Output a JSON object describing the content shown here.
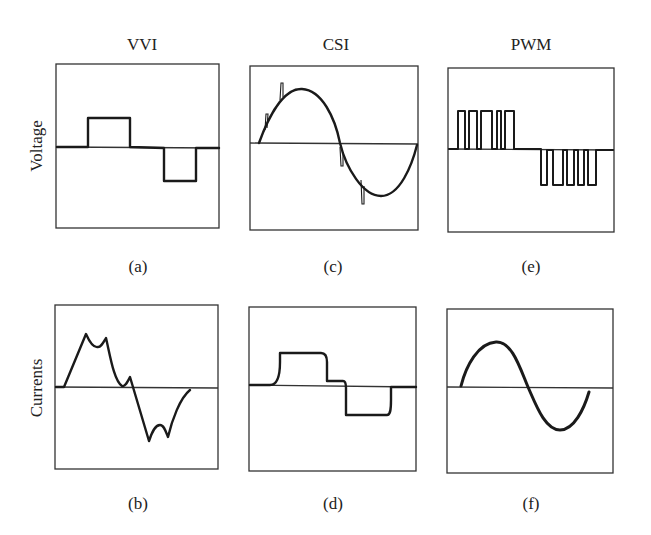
{
  "columns": [
    {
      "title": "VVI"
    },
    {
      "title": "CSI"
    },
    {
      "title": "PWM"
    }
  ],
  "row_labels": {
    "voltage": "Voltage",
    "currents": "Currents"
  },
  "captions": {
    "a": "(a)",
    "b": "(b)",
    "c": "(c)",
    "d": "(d)",
    "e": "(e)",
    "f": "(f)"
  },
  "panels": [
    {
      "id": "a",
      "inverter": "VVI",
      "quantity": "Voltage",
      "shape": "quasi-square wave (positive pulse, zero, negative pulse)"
    },
    {
      "id": "c",
      "inverter": "CSI",
      "quantity": "Voltage",
      "shape": "sinusoid with commutation spikes"
    },
    {
      "id": "e",
      "inverter": "PWM",
      "quantity": "Voltage",
      "shape": "pulse-width modulated pulse trains (4 positive, 4 negative)"
    },
    {
      "id": "b",
      "inverter": "VVI",
      "quantity": "Currents",
      "shape": "six-step current with double-hump peaks"
    },
    {
      "id": "d",
      "inverter": "CSI",
      "quantity": "Currents",
      "shape": "rounded quasi-square current"
    },
    {
      "id": "f",
      "inverter": "PWM",
      "quantity": "Currents",
      "shape": "near-sinusoid with small ripple"
    }
  ],
  "colors": {
    "line": "#1a1a1a",
    "frame": "#333333",
    "background": "#ffffff"
  }
}
